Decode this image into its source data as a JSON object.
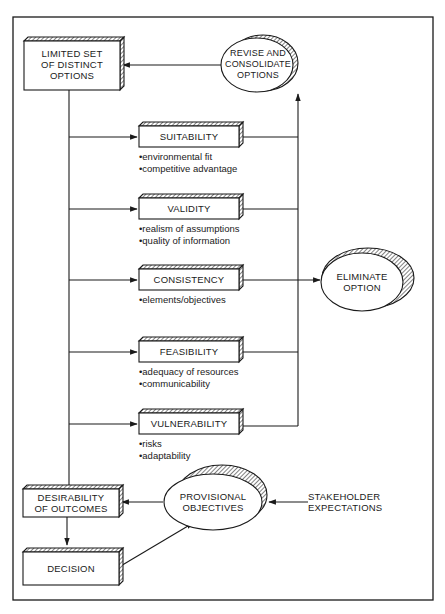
{
  "diagram": {
    "nodes": {
      "limited_set": "LIMITED SET OF DISTINCT OPTIONS",
      "revise": "REVISE AND CONSOLIDATE OPTIONS",
      "suitability": "SUITABILITY",
      "validity": "VALIDITY",
      "consistency": "CONSISTENCY",
      "feasibility": "FEASIBILITY",
      "vulnerability": "VULNERABILITY",
      "eliminate": "ELIMINATE OPTION",
      "desirability": "DESIRABILITY OF OUTCOMES",
      "provisional": "PROVISIONAL OBJECTIVES",
      "stakeholder": "STAKEHOLDER EXPECTATIONS",
      "decision": "DECISION"
    },
    "lines": {
      "limited_set": [
        "LIMITED SET",
        "OF DISTINCT",
        "OPTIONS"
      ],
      "revise": [
        "REVISE AND",
        "CONSOLIDATE",
        "OPTIONS"
      ],
      "eliminate": [
        "ELIMINATE",
        "OPTION"
      ],
      "desirability": [
        "DESIRABILITY",
        "OF OUTCOMES"
      ],
      "provisional": [
        "PROVISIONAL",
        "OBJECTIVES"
      ],
      "stakeholder": [
        "STAKEHOLDER",
        "EXPECTATIONS"
      ]
    },
    "criteria": {
      "suitability": [
        "environmental fit",
        "competitive advantage"
      ],
      "validity": [
        "realism of assumptions",
        "quality of information"
      ],
      "consistency": [
        "elements/objectives"
      ],
      "feasibility": [
        "adequacy of resources",
        "communicability"
      ],
      "vulnerability": [
        "risks",
        "adaptability"
      ]
    },
    "edges": [
      {
        "from": "limited_set",
        "to": "suitability"
      },
      {
        "from": "limited_set",
        "to": "validity"
      },
      {
        "from": "limited_set",
        "to": "consistency"
      },
      {
        "from": "limited_set",
        "to": "feasibility"
      },
      {
        "from": "limited_set",
        "to": "vulnerability"
      },
      {
        "from": "limited_set",
        "to": "desirability"
      },
      {
        "from": "suitability",
        "to": "revise"
      },
      {
        "from": "validity",
        "to": "revise"
      },
      {
        "from": "feasibility",
        "to": "revise"
      },
      {
        "from": "vulnerability",
        "to": "revise"
      },
      {
        "from": "consistency",
        "to": "eliminate"
      },
      {
        "from": "revise",
        "to": "limited_set"
      },
      {
        "from": "stakeholder",
        "to": "provisional"
      },
      {
        "from": "provisional",
        "to": "desirability"
      },
      {
        "from": "desirability",
        "to": "decision"
      },
      {
        "from": "decision",
        "to": "provisional"
      }
    ],
    "colors": {
      "ink": "#1a1a1a",
      "paper": "#ffffff"
    }
  }
}
